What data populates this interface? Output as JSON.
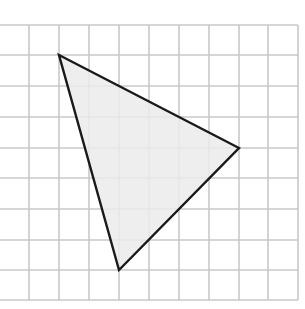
{
  "diagram": {
    "type": "triangle-on-grid",
    "caption": "",
    "colors": {
      "background": "#ffffff",
      "grid_line": "#c8c8c8",
      "triangle_fill": "#ebebeb",
      "triangle_stroke": "#1a1a1a"
    },
    "grid": {
      "vertical_lines_x": [
        29,
        59,
        89,
        119,
        149,
        179,
        209,
        239,
        268,
        298
      ],
      "horizontal_lines_y": [
        25,
        55,
        86,
        117,
        148,
        178,
        209,
        240,
        270,
        300
      ],
      "x_extent": [
        0,
        298
      ],
      "y_extent": [
        25,
        300
      ],
      "cell_size_px": 30
    },
    "triangle": {
      "vertices": [
        {
          "name": "A",
          "x": 59,
          "y": 55,
          "grid_col": 2,
          "grid_row": 1
        },
        {
          "name": "B",
          "x": 239,
          "y": 148,
          "grid_col": 8,
          "grid_row": 4
        },
        {
          "name": "C",
          "x": 119,
          "y": 270,
          "grid_col": 4,
          "grid_row": 8
        }
      ]
    }
  }
}
